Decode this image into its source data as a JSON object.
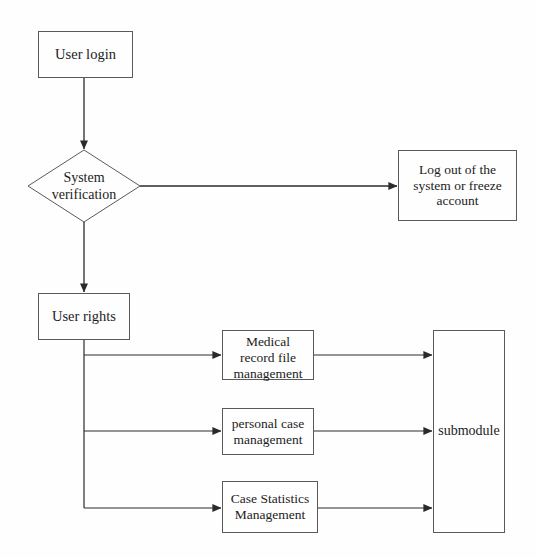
{
  "diagram": {
    "background_color": "#fefefe",
    "stroke_color": "#5a5a5a",
    "text_color": "#1c1c1c",
    "nodes": {
      "user_login": {
        "label": "User login",
        "shape": "rectangle"
      },
      "system_verification": {
        "label": "System\nverification",
        "shape": "diamond"
      },
      "logout_or_freeze": {
        "label": "Log out of the\nsystem or freeze\naccount",
        "shape": "rectangle"
      },
      "user_rights": {
        "label": "User rights",
        "shape": "rectangle"
      },
      "medical_record_file_management": {
        "label": "Medical\nrecord file\nmanagement",
        "shape": "rectangle"
      },
      "personal_case_management": {
        "label": "personal case\nmanagement",
        "shape": "rectangle"
      },
      "case_statistics_management": {
        "label": "Case Statistics\nManagement",
        "shape": "rectangle"
      },
      "submodule": {
        "label": "submodule",
        "shape": "rectangle"
      }
    },
    "edges": [
      {
        "from": "user_login",
        "to": "system_verification",
        "direction": "down",
        "arrow": true
      },
      {
        "from": "system_verification",
        "to": "logout_or_freeze",
        "direction": "right",
        "arrow": true
      },
      {
        "from": "system_verification",
        "to": "user_rights",
        "direction": "down",
        "arrow": true
      },
      {
        "from": "user_rights",
        "to": "medical_record_file_management",
        "direction": "right",
        "arrow": true
      },
      {
        "from": "user_rights",
        "to": "personal_case_management",
        "direction": "right",
        "arrow": true
      },
      {
        "from": "user_rights",
        "to": "case_statistics_management",
        "direction": "right",
        "arrow": true
      },
      {
        "from": "medical_record_file_management",
        "to": "submodule",
        "direction": "right",
        "arrow": true
      },
      {
        "from": "personal_case_management",
        "to": "submodule",
        "direction": "right",
        "arrow": true
      },
      {
        "from": "case_statistics_management",
        "to": "submodule",
        "direction": "right",
        "arrow": true
      }
    ]
  }
}
